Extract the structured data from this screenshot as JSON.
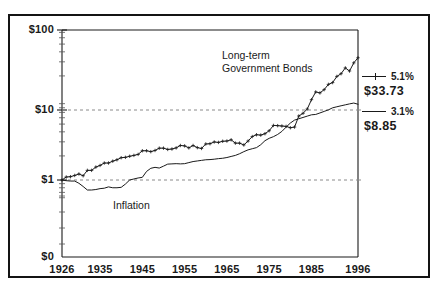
{
  "chart_data": {
    "type": "line",
    "title": "",
    "xlabel": "",
    "ylabel": "",
    "yscale": "log",
    "ylim": [
      0.55,
      100
    ],
    "xlim": [
      1926,
      1996
    ],
    "grid": "dashed horizontal gridlines at $10 and $1",
    "legend_position": "right",
    "ytick_labels": [
      "$100",
      "$10",
      "$1",
      "$0"
    ],
    "ytick_values": [
      100,
      10,
      1,
      0
    ],
    "xtick_labels": [
      "1926",
      "1935",
      "1945",
      "1955",
      "1965",
      "1975",
      "1985",
      "1996"
    ],
    "xtick_values": [
      1926,
      1935,
      1945,
      1955,
      1965,
      1975,
      1985,
      1996
    ],
    "annotations": [
      {
        "text": "Long-term",
        "x": 1968,
        "y": 46
      },
      {
        "text": "Government Bonds",
        "x": 1968,
        "y": 36
      },
      {
        "text": "Inflation",
        "x": 1943,
        "y": 0.72
      }
    ],
    "series": [
      {
        "name": "Long-term Government Bonds",
        "rate": "5.1%",
        "end_value": "$33.73",
        "marker": "plus",
        "x": [
          1926,
          1927,
          1928,
          1929,
          1930,
          1931,
          1932,
          1933,
          1934,
          1935,
          1936,
          1937,
          1938,
          1939,
          1940,
          1941,
          1942,
          1943,
          1944,
          1945,
          1946,
          1947,
          1948,
          1949,
          1950,
          1951,
          1952,
          1953,
          1954,
          1955,
          1956,
          1957,
          1958,
          1959,
          1960,
          1961,
          1962,
          1963,
          1964,
          1965,
          1966,
          1967,
          1968,
          1969,
          1970,
          1971,
          1972,
          1973,
          1974,
          1975,
          1976,
          1977,
          1978,
          1979,
          1980,
          1981,
          1982,
          1983,
          1984,
          1985,
          1986,
          1987,
          1988,
          1989,
          1990,
          1991,
          1992,
          1993,
          1994,
          1995,
          1996
        ],
        "values": [
          1.0,
          1.09,
          1.1,
          1.14,
          1.19,
          1.13,
          1.32,
          1.32,
          1.45,
          1.52,
          1.63,
          1.63,
          1.72,
          1.79,
          1.9,
          1.92,
          1.98,
          2.03,
          2.09,
          2.32,
          2.32,
          2.26,
          2.34,
          2.5,
          2.5,
          2.41,
          2.44,
          2.52,
          2.7,
          2.67,
          2.52,
          2.7,
          2.54,
          2.48,
          2.82,
          2.84,
          2.99,
          2.95,
          3.05,
          3.07,
          3.18,
          2.89,
          2.89,
          2.74,
          3.07,
          3.49,
          3.68,
          3.64,
          3.79,
          4.13,
          4.81,
          4.78,
          4.73,
          4.68,
          4.5,
          4.59,
          6.31,
          6.82,
          7.72,
          10.1,
          12.61,
          12.26,
          13.47,
          15.68,
          16.51,
          19.72,
          21.31,
          25.2,
          23.01,
          29.1,
          33.73
        ]
      },
      {
        "name": "Inflation",
        "rate": "3.1%",
        "end_value": "$8.85",
        "marker": "none",
        "x": [
          1926,
          1927,
          1928,
          1929,
          1930,
          1931,
          1932,
          1933,
          1934,
          1935,
          1936,
          1937,
          1938,
          1939,
          1940,
          1941,
          1942,
          1943,
          1944,
          1945,
          1946,
          1947,
          1948,
          1949,
          1950,
          1951,
          1952,
          1953,
          1954,
          1955,
          1956,
          1957,
          1958,
          1959,
          1960,
          1961,
          1962,
          1963,
          1964,
          1965,
          1966,
          1967,
          1968,
          1969,
          1970,
          1971,
          1972,
          1973,
          1974,
          1975,
          1976,
          1977,
          1978,
          1979,
          1980,
          1981,
          1982,
          1983,
          1984,
          1985,
          1986,
          1987,
          1988,
          1989,
          1990,
          1991,
          1992,
          1993,
          1994,
          1995,
          1996
        ],
        "values": [
          1.0,
          0.98,
          0.97,
          0.97,
          0.91,
          0.83,
          0.75,
          0.75,
          0.76,
          0.78,
          0.79,
          0.82,
          0.8,
          0.8,
          0.81,
          0.89,
          1.0,
          1.03,
          1.06,
          1.08,
          1.28,
          1.4,
          1.44,
          1.41,
          1.49,
          1.58,
          1.59,
          1.6,
          1.59,
          1.6,
          1.65,
          1.7,
          1.73,
          1.76,
          1.79,
          1.8,
          1.82,
          1.85,
          1.87,
          1.91,
          1.97,
          2.03,
          2.13,
          2.26,
          2.38,
          2.46,
          2.54,
          2.76,
          3.1,
          3.32,
          3.48,
          3.71,
          4.05,
          4.58,
          5.15,
          5.61,
          5.83,
          6.05,
          6.29,
          6.53,
          6.6,
          6.89,
          7.2,
          7.53,
          7.99,
          8.23,
          8.47,
          8.7,
          8.94,
          9.16,
          8.85
        ]
      }
    ]
  },
  "axis": {
    "y_labels": [
      {
        "text": "$100"
      },
      {
        "text": "$10"
      },
      {
        "text": "$1"
      },
      {
        "text": "$0"
      }
    ],
    "x_labels": [
      {
        "text": "1926"
      },
      {
        "text": "1935"
      },
      {
        "text": "1945"
      },
      {
        "text": "1955"
      },
      {
        "text": "1965"
      },
      {
        "text": "1975"
      },
      {
        "text": "1985"
      },
      {
        "text": "1996"
      }
    ]
  },
  "annotations": {
    "bonds_line1": "Long-term",
    "bonds_line2": "Government Bonds",
    "inflation": "Inflation"
  },
  "legend": {
    "entries": [
      {
        "pct": "5.1%",
        "value": "$33.73",
        "marker": "plus-line"
      },
      {
        "pct": "3.1%",
        "value": "$8.85",
        "marker": "line"
      }
    ]
  },
  "colors": {
    "ink": "#1a1a1a",
    "grid": "#8a8a8a",
    "frame": "#141414",
    "background": "#ffffff"
  }
}
